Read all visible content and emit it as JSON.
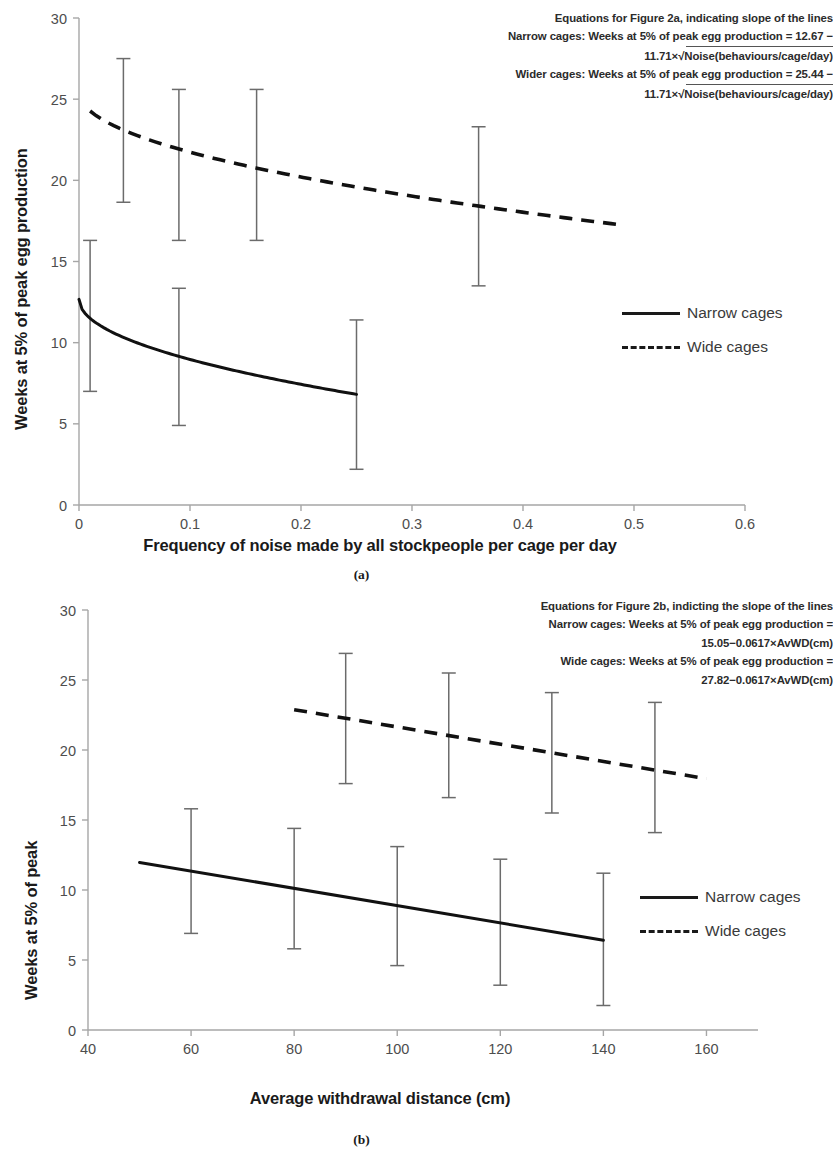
{
  "figure": {
    "panels": [
      "a",
      "b"
    ]
  },
  "panel_a": {
    "caption": "(a)",
    "xlabel": "Frequency of noise made by all stockpeople per cage per day",
    "ylabel": "Weeks at 5% of peak egg production",
    "legend": [
      {
        "label": "Narrow cages",
        "style": "solid"
      },
      {
        "label": "Wide cages",
        "style": "dashed"
      }
    ],
    "equations": {
      "heading": "Equations for Figure 2a, indicating slope of the lines",
      "line1": "Narrow cages: Weeks at 5% of peak egg production = 12.67 −",
      "line2_prefix": "11.71×",
      "line2_radicand": "Noise(behaviours/cage/day)",
      "line3": "Wider cages: Weeks at 5% of peak egg production = 25.44 −",
      "line4_prefix": "11.71×",
      "line4_radicand": "Noise(behaviours/cage/day)"
    }
  },
  "panel_b": {
    "caption": "(b)",
    "xlabel": "Average withdrawal distance (cm)",
    "ylabel": "Weeks at 5% of peak",
    "legend": [
      {
        "label": "Narrow cages",
        "style": "solid"
      },
      {
        "label": "Wide cages",
        "style": "dashed"
      }
    ],
    "equations": {
      "heading": "Equations for Figure 2b, indicting the slope of the lines",
      "line1": "Narrow cages: Weeks at 5% of peak egg production  =",
      "line2": "15.05−0.0617×AvWD(cm)",
      "line3": "Wide cages: Weeks at 5% of peak egg production =",
      "line4": "27.82−0.0617×AvWD(cm)"
    }
  },
  "chart_data": [
    {
      "type": "line",
      "id": "figure-2a",
      "title": "Equations for Figure 2a, indicating slope of the lines",
      "xlabel": "Frequency of noise made by all stockpeople per cage per day",
      "ylabel": "Weeks at 5% of peak egg production",
      "xlim": [
        0,
        0.6
      ],
      "ylim": [
        0,
        30
      ],
      "xticks": [
        0,
        0.1,
        0.2,
        0.3,
        0.4,
        0.5,
        0.6
      ],
      "yticks": [
        0,
        5,
        10,
        15,
        20,
        25,
        30
      ],
      "xtick_labels": [
        "0",
        "0.1",
        "0.2",
        "0.3",
        "0.4",
        "0.5",
        "0.6"
      ],
      "ytick_labels": [
        "0",
        "5",
        "10",
        "15",
        "20",
        "25",
        "30"
      ],
      "grid": false,
      "legend_position": "right",
      "model": "Weeks = a - 11.71 * sqrt(Noise)",
      "series": [
        {
          "name": "Narrow cages",
          "style": "solid",
          "intercept": 12.67,
          "slope_sqrt": -11.71,
          "x": [
            0.0,
            0.01,
            0.04,
            0.09,
            0.16,
            0.25
          ],
          "y": [
            12.67,
            11.5,
            10.33,
            9.16,
            7.99,
            6.81
          ],
          "errorbars": [
            {
              "x": 0.01,
              "y": 11.5,
              "low": 7.0,
              "high": 16.3
            },
            {
              "x": 0.09,
              "y": 9.16,
              "low": 4.9,
              "high": 13.35
            },
            {
              "x": 0.25,
              "y": 6.81,
              "low": 2.2,
              "high": 11.4
            }
          ]
        },
        {
          "name": "Wide cages",
          "style": "dashed",
          "intercept": 25.44,
          "slope_sqrt": -11.71,
          "x": [
            0.01,
            0.04,
            0.09,
            0.16,
            0.25,
            0.36,
            0.49
          ],
          "y": [
            24.27,
            23.1,
            21.93,
            20.76,
            19.59,
            18.41,
            17.24
          ],
          "errorbars": [
            {
              "x": 0.04,
              "y": 23.1,
              "low": 18.65,
              "high": 27.5
            },
            {
              "x": 0.09,
              "y": 21.93,
              "low": 16.3,
              "high": 25.6
            },
            {
              "x": 0.16,
              "y": 20.76,
              "low": 16.3,
              "high": 25.6
            },
            {
              "x": 0.36,
              "y": 18.41,
              "low": 13.5,
              "high": 23.3
            }
          ]
        }
      ]
    },
    {
      "type": "line",
      "id": "figure-2b",
      "title": "Equations for Figure 2b, indicting the slope of the lines",
      "xlabel": "Average withdrawal distance (cm)",
      "ylabel": "Weeks at 5% of peak",
      "xlim": [
        40,
        170
      ],
      "ylim": [
        0,
        30
      ],
      "xticks": [
        40,
        60,
        80,
        100,
        120,
        140,
        160
      ],
      "yticks": [
        0,
        5,
        10,
        15,
        20,
        25,
        30
      ],
      "xtick_labels": [
        "40",
        "60",
        "80",
        "100",
        "120",
        "140",
        "160"
      ],
      "ytick_labels": [
        "0",
        "5",
        "10",
        "15",
        "20",
        "25",
        "30"
      ],
      "grid": false,
      "legend_position": "right",
      "model": "Weeks = a - 0.0617 * AvWD(cm)",
      "series": [
        {
          "name": "Narrow cages",
          "style": "solid",
          "intercept": 15.05,
          "slope": -0.0617,
          "x": [
            50,
            140
          ],
          "y": [
            11.97,
            6.41
          ],
          "errorbars": [
            {
              "x": 60,
              "y": 11.35,
              "low": 6.9,
              "high": 15.8
            },
            {
              "x": 80,
              "y": 10.11,
              "low": 5.8,
              "high": 14.4
            },
            {
              "x": 100,
              "y": 8.88,
              "low": 4.6,
              "high": 13.1
            },
            {
              "x": 120,
              "y": 7.65,
              "low": 3.2,
              "high": 12.2
            },
            {
              "x": 140,
              "y": 6.41,
              "low": 1.75,
              "high": 11.2
            }
          ]
        },
        {
          "name": "Wide cages",
          "style": "dashed",
          "intercept": 27.82,
          "slope": -0.0617,
          "x": [
            80,
            160
          ],
          "y": [
            22.88,
            17.95
          ],
          "errorbars": [
            {
              "x": 90,
              "y": 22.27,
              "low": 17.6,
              "high": 26.9
            },
            {
              "x": 110,
              "y": 21.03,
              "low": 16.6,
              "high": 25.5
            },
            {
              "x": 130,
              "y": 19.8,
              "low": 15.5,
              "high": 24.1
            },
            {
              "x": 150,
              "y": 18.56,
              "low": 14.1,
              "high": 23.4
            }
          ]
        }
      ]
    }
  ]
}
